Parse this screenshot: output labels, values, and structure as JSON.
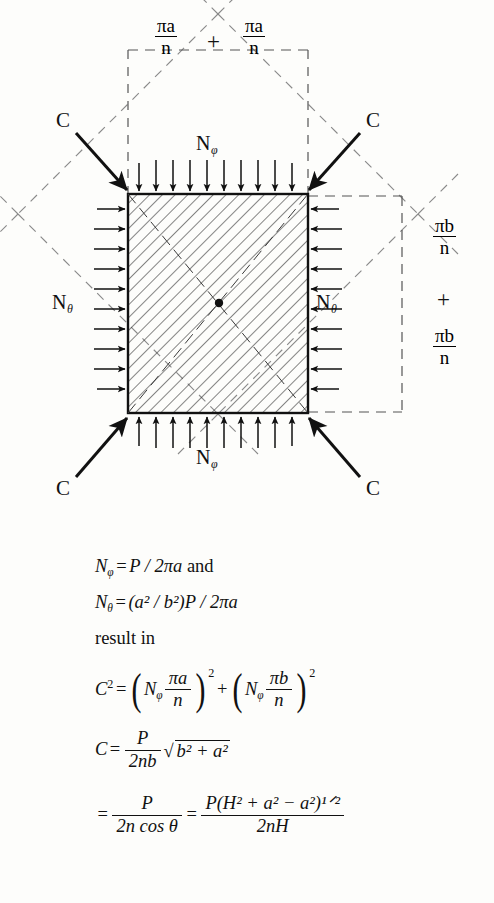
{
  "figure": {
    "corner_labels": [
      {
        "name": "corner-force-top-left",
        "text": "C"
      },
      {
        "name": "corner-force-top-right",
        "text": "C"
      },
      {
        "name": "corner-force-bottom-left",
        "text": "C"
      },
      {
        "name": "corner-force-bottom-right",
        "text": "C"
      }
    ],
    "edge_labels": [
      {
        "name": "load-label-top",
        "symbol": "N",
        "sub": "φ"
      },
      {
        "name": "load-label-bottom",
        "symbol": "N",
        "sub": "φ"
      },
      {
        "name": "load-label-left",
        "symbol": "N",
        "sub": "θ"
      },
      {
        "name": "load-label-right",
        "symbol": "N",
        "sub": "θ"
      }
    ],
    "dimensions": {
      "top_left": {
        "num": "πa",
        "den": "n"
      },
      "top_right": {
        "num": "πa",
        "den": "n"
      },
      "right_top": {
        "num": "πb",
        "den": "n"
      },
      "right_bottom": {
        "num": "πb",
        "den": "n"
      },
      "plus_top": "+",
      "plus_right": "+"
    },
    "colors": {
      "line": "#111111",
      "hatch": "#2b2b2b",
      "dashed": "#7c7c7c",
      "background": "#fdfdfb"
    }
  },
  "equations": {
    "line1": {
      "lhs_symbol": "N",
      "lhs_sub": "φ",
      "eq": "=",
      "rhs": "P / 2πa",
      "trailing_word": "and"
    },
    "line2": {
      "lhs_symbol": "N",
      "lhs_sub": "θ",
      "eq": "=",
      "rhs": "(a² / b²)P / 2πa"
    },
    "line3_text": "result in",
    "line4": {
      "lhs": "C",
      "lhs_sup": "2",
      "eq": "=",
      "term1": {
        "symbol": "N",
        "sub": "φ",
        "num": "πa",
        "den": "n",
        "sup": "2"
      },
      "plus": "+",
      "term2": {
        "symbol": "N",
        "sub": "φ",
        "num": "πb",
        "den": "n",
        "sup": "2"
      }
    },
    "line5": {
      "lhs": "C",
      "eq": "=",
      "frac_num": "P",
      "frac_den": "2nb",
      "sqrt": "b² + a²"
    },
    "line6": {
      "eq1": "=",
      "frac1_num": "P",
      "frac1_den": "2n cos θ",
      "eq2": "=",
      "frac2_num": "P(H² + a² − a²)¹ᐟ²",
      "frac2_den": "2nH"
    }
  },
  "glyphs": {
    "pi": "π",
    "phi": "φ",
    "theta": "θ",
    "minus": "−",
    "radical": "√"
  }
}
